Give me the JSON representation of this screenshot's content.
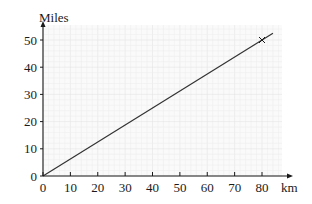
{
  "chart_data": {
    "type": "line",
    "title": "",
    "xlabel": "km",
    "ylabel": "Miles",
    "xlim": [
      0,
      80
    ],
    "ylim": [
      0,
      50
    ],
    "x_ticks": [
      0,
      10,
      20,
      30,
      40,
      50,
      60,
      70,
      80
    ],
    "y_ticks": [
      0,
      10,
      20,
      30,
      40,
      50
    ],
    "x_tick_labels": [
      "0",
      "10",
      "20",
      "30",
      "40",
      "50",
      "60",
      "70",
      "80"
    ],
    "y_tick_labels": [
      "0",
      "10",
      "20",
      "30",
      "40",
      "50"
    ],
    "grid": true,
    "legend": null,
    "series": [
      {
        "name": "km to miles conversion",
        "x": [
          0,
          84
        ],
        "y": [
          0,
          52.5
        ],
        "color": "#333333"
      }
    ],
    "annotations": [
      {
        "type": "cross-marker",
        "x": 80,
        "y": 50
      }
    ]
  },
  "colors": {
    "axis": "#1a1a1a",
    "line": "#333333",
    "grid_minor": "#eeeeee",
    "grid_major": "#e4e4e4",
    "plot_background": "#fafafa"
  }
}
